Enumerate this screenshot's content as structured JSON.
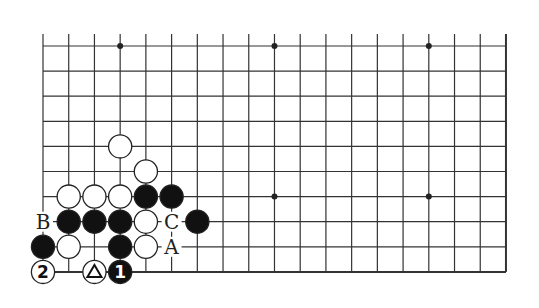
{
  "diagram": {
    "type": "go-board-fragment",
    "grid": {
      "columns": 19,
      "rows": 10,
      "origin_x": 43,
      "origin_y": 46,
      "spacing_x": 25.72,
      "spacing_y": 25.1,
      "line_color": "#333333",
      "top_edge_open": true,
      "left_edge_stub": true
    },
    "star_points": [
      {
        "col": 3,
        "row": 0
      },
      {
        "col": 9,
        "row": 0
      },
      {
        "col": 15,
        "row": 0
      },
      {
        "col": 9,
        "row": 6
      },
      {
        "col": 15,
        "row": 6
      }
    ],
    "stones": [
      {
        "col": 3,
        "row": 4,
        "color": "white"
      },
      {
        "col": 4,
        "row": 5,
        "color": "white"
      },
      {
        "col": 1,
        "row": 6,
        "color": "white"
      },
      {
        "col": 2,
        "row": 6,
        "color": "white"
      },
      {
        "col": 3,
        "row": 6,
        "color": "white"
      },
      {
        "col": 4,
        "row": 6,
        "color": "black"
      },
      {
        "col": 5,
        "row": 6,
        "color": "black"
      },
      {
        "col": 1,
        "row": 7,
        "color": "black"
      },
      {
        "col": 2,
        "row": 7,
        "color": "black"
      },
      {
        "col": 3,
        "row": 7,
        "color": "black"
      },
      {
        "col": 4,
        "row": 7,
        "color": "white"
      },
      {
        "col": 6,
        "row": 7,
        "color": "black"
      },
      {
        "col": 0,
        "row": 8,
        "color": "black"
      },
      {
        "col": 1,
        "row": 8,
        "color": "white"
      },
      {
        "col": 3,
        "row": 8,
        "color": "black"
      },
      {
        "col": 4,
        "row": 8,
        "color": "white"
      },
      {
        "col": 0,
        "row": 9,
        "color": "white",
        "label": "2"
      },
      {
        "col": 2,
        "row": 9,
        "color": "white",
        "label": "△"
      },
      {
        "col": 3,
        "row": 9,
        "color": "black",
        "label": "1"
      }
    ],
    "letters": [
      {
        "col": 0,
        "row": 7,
        "text": "B"
      },
      {
        "col": 5,
        "row": 7,
        "text": "C"
      },
      {
        "col": 5,
        "row": 8,
        "text": "A"
      }
    ]
  }
}
